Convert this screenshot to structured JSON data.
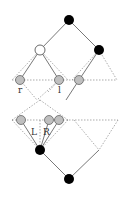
{
  "diagram": {
    "type": "tree-rotation",
    "labels": {
      "r": "r",
      "l": "l",
      "L": "L",
      "R": "R"
    },
    "colors": {
      "filled_node": "#000000",
      "hollow_node": "#ffffff",
      "hatched_node": "#cccccc",
      "edge": "#555555",
      "dashed": "#888888"
    },
    "nodes": [
      {
        "id": "top",
        "kind": "filled",
        "x": 69,
        "y": 20
      },
      {
        "id": "left-child",
        "kind": "hollow",
        "x": 40,
        "y": 50
      },
      {
        "id": "right-child",
        "kind": "filled",
        "x": 99,
        "y": 50
      },
      {
        "id": "r-node",
        "kind": "hatched",
        "x": 20,
        "y": 80
      },
      {
        "id": "l-node",
        "kind": "hatched",
        "x": 59,
        "y": 80
      },
      {
        "id": "mid-node",
        "kind": "hatched",
        "x": 79,
        "y": 80
      },
      {
        "id": "L-node",
        "kind": "hatched",
        "x": 21,
        "y": 120
      },
      {
        "id": "R-node1",
        "kind": "hatched",
        "x": 49,
        "y": 120
      },
      {
        "id": "R-node2",
        "kind": "hatched",
        "x": 59,
        "y": 120
      },
      {
        "id": "lower-filled",
        "kind": "filled",
        "x": 40,
        "y": 150
      },
      {
        "id": "bottom",
        "kind": "filled",
        "x": 69,
        "y": 179
      }
    ]
  }
}
